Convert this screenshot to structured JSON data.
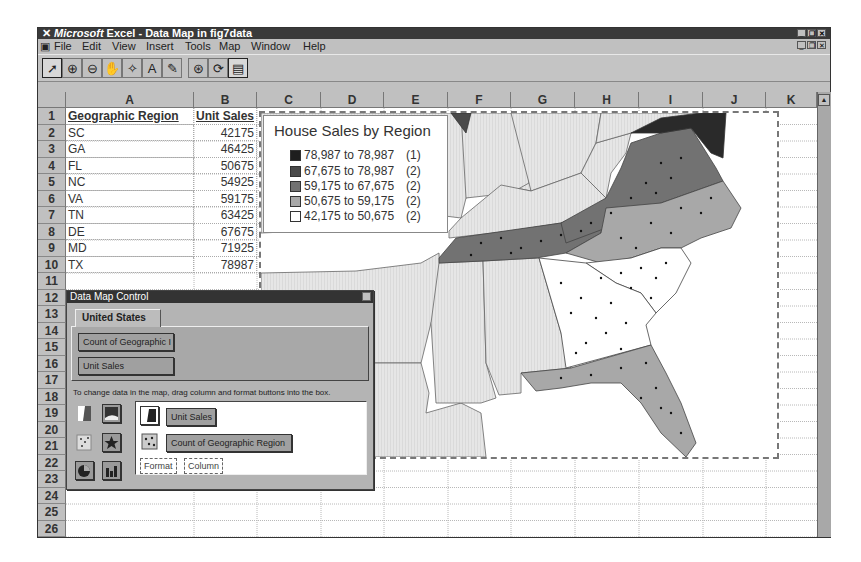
{
  "window": {
    "title_brand": "Microsoft",
    "title_rest": " Excel - Data Map in fig7data",
    "controls": [
      "minimize",
      "restore",
      "close"
    ]
  },
  "menu": {
    "items": [
      {
        "label": "File",
        "accel": "F"
      },
      {
        "label": "Edit",
        "accel": "E"
      },
      {
        "label": "View",
        "accel": "V"
      },
      {
        "label": "Insert",
        "accel": "I"
      },
      {
        "label": "Tools",
        "accel": "T"
      },
      {
        "label": "Map",
        "accel": "M"
      },
      {
        "label": "Window",
        "accel": "W"
      },
      {
        "label": "Help",
        "accel": "H"
      }
    ]
  },
  "toolbar": {
    "buttons": [
      {
        "name": "select-objects",
        "glyph": "➚"
      },
      {
        "name": "zoom-in",
        "glyph": "⊕"
      },
      {
        "name": "zoom-out",
        "glyph": "⊖"
      },
      {
        "name": "grabber",
        "glyph": "✋"
      },
      {
        "name": "center-map",
        "glyph": "✧"
      },
      {
        "name": "add-text",
        "glyph": "A"
      },
      {
        "name": "custom-pin",
        "glyph": "✎"
      },
      {
        "name": "display-entire",
        "glyph": "⊛"
      },
      {
        "name": "redraw-map",
        "glyph": "⟳"
      },
      {
        "name": "show-control",
        "glyph": "▤"
      }
    ]
  },
  "sheet": {
    "columns": [
      "A",
      "B",
      "C",
      "D",
      "E",
      "F",
      "G",
      "H",
      "I",
      "J",
      "K"
    ],
    "rows": [
      "1",
      "2",
      "3",
      "4",
      "5",
      "6",
      "7",
      "8",
      "9",
      "10",
      "11",
      "12",
      "13",
      "14",
      "15",
      "16",
      "17",
      "18",
      "19",
      "20",
      "21",
      "22",
      "23",
      "24",
      "25",
      "26"
    ],
    "header": {
      "a": "Geographic Region",
      "b": "Unit Sales"
    },
    "data": [
      {
        "region": "SC",
        "sales": "42175"
      },
      {
        "region": "GA",
        "sales": "46425"
      },
      {
        "region": "FL",
        "sales": "50675"
      },
      {
        "region": "NC",
        "sales": "54925"
      },
      {
        "region": "VA",
        "sales": "59175"
      },
      {
        "region": "TN",
        "sales": "63425"
      },
      {
        "region": "DE",
        "sales": "67675"
      },
      {
        "region": "MD",
        "sales": "71925"
      },
      {
        "region": "TX",
        "sales": "78987"
      }
    ]
  },
  "map": {
    "title": "House Sales by Region",
    "legend": [
      {
        "range": "78,987 to 78,987",
        "count": "(1)",
        "color": "#1e1e1e"
      },
      {
        "range": "67,675 to 78,987",
        "count": "(2)",
        "color": "#4a4a4a"
      },
      {
        "range": "59,175 to 67,675",
        "count": "(2)",
        "color": "#727272"
      },
      {
        "range": "50,675 to 59,175",
        "count": "(2)",
        "color": "#a8a8a8"
      },
      {
        "range": "42,175 to 50,675",
        "count": "(2)",
        "color": "#ffffff"
      }
    ],
    "colors": {
      "MD": "#2a2a2a",
      "VA": "#727272",
      "TN": "#727272",
      "NC": "#a8a8a8",
      "FL": "#a8a8a8",
      "SC": "#ffffff",
      "GA": "#ffffff",
      "other": "#dcdcdc"
    }
  },
  "data_map_control": {
    "title": "Data Map Control",
    "tab": "United States",
    "columns_available": [
      "Count of Geographic I",
      "Unit Sales"
    ],
    "hint": "To change data in the map, drag column and format buttons into the box.",
    "active_items": [
      "Unit Sales",
      "Count of Geographic Region"
    ],
    "placeholders": [
      "Format",
      "Column"
    ]
  }
}
